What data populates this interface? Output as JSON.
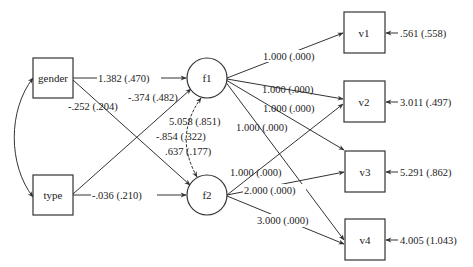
{
  "diagram": {
    "type": "structural-equation-model path diagram",
    "observed_exogenous": [
      {
        "id": "gender",
        "label": "gender"
      },
      {
        "id": "type",
        "label": "type"
      }
    ],
    "latent": [
      {
        "id": "f1",
        "label": "f1"
      },
      {
        "id": "f2",
        "label": "f2"
      }
    ],
    "indicators": [
      {
        "id": "v1",
        "label": "v1",
        "residual": ".561 (.558)"
      },
      {
        "id": "v2",
        "label": "v2",
        "residual": "3.011 (.497)"
      },
      {
        "id": "v3",
        "label": "v3",
        "residual": "5.291 (.862)"
      },
      {
        "id": "v4",
        "label": "v4",
        "residual": "4.005 (1.043)"
      }
    ],
    "paths": {
      "gender_f1": "1.382 (.470)",
      "gender_f2": "-.252 (.204)",
      "type_f1": "-.374 (.482)",
      "type_f2": "-.036 (.210)",
      "f1_v1": "1.000 (.000)",
      "f1_v2": "1.000 (.000)",
      "f1_v3": "1.000 (.000)",
      "f1_v4": "1.000 (.000)",
      "f2_v2": "1.000 (.000)",
      "f2_v3": "2.000 (.000)",
      "f2_v4": "3.000 (.000)"
    },
    "covariances": {
      "f1_var": "5.058 (.851)",
      "f1_f2_cov": "-.854 (.322)",
      "f2_var": ".637 (.177)",
      "gender_type": ""
    }
  }
}
